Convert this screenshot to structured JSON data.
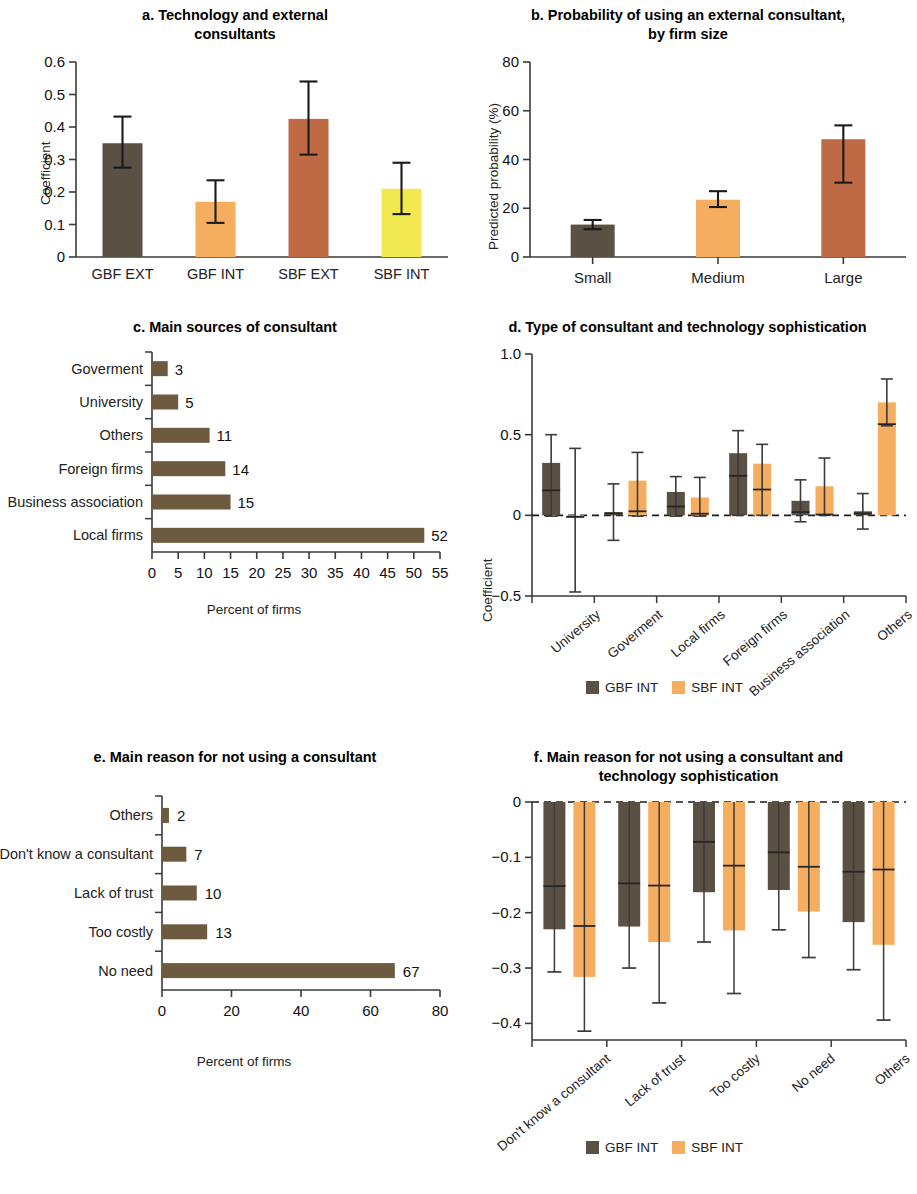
{
  "colors": {
    "dark_brown": "#5a5043",
    "orange": "#f5ad5f",
    "sienna": "#bd6a45",
    "yellow": "#f2e84f",
    "bar_brown": "#6d5a3f",
    "axis": "#3a3a3a",
    "text": "#111111"
  },
  "legend": {
    "series": [
      {
        "label": "GBF INT",
        "color": "#5a5043"
      },
      {
        "label": "SBF INT",
        "color": "#f5ad5f"
      }
    ]
  },
  "chart_data": [
    {
      "id": "a",
      "type": "bar",
      "title": "a. Technology and external consultants",
      "title_lines": [
        "a. Technology and external",
        "consultants"
      ],
      "xlabel": "",
      "ylabel": "Coefficient",
      "ylim": [
        0,
        0.6
      ],
      "yticks": [
        "0",
        "0.1",
        "0.2",
        "0.3",
        "0.4",
        "0.5",
        "0.6"
      ],
      "ytickvals": [
        0,
        0.1,
        0.2,
        0.3,
        0.4,
        0.5,
        0.6
      ],
      "grid": false,
      "categories": [
        "GBF EXT",
        "GBF INT",
        "SBF EXT",
        "SBF INT"
      ],
      "values": [
        0.35,
        0.17,
        0.425,
        0.21
      ],
      "ci_low": [
        0.275,
        0.105,
        0.315,
        0.132
      ],
      "ci_high": [
        0.432,
        0.236,
        0.54,
        0.29
      ],
      "bar_colors": [
        "#5a5043",
        "#f5ad5f",
        "#bd6a45",
        "#f2e84f"
      ]
    },
    {
      "id": "b",
      "type": "bar",
      "title": "b. Probability of using an external consultant, by firm size",
      "title_lines": [
        "b. Probability of using an external consultant,",
        "by firm size"
      ],
      "xlabel": "",
      "ylabel": "Predicted probability (%)",
      "ylim": [
        0,
        80
      ],
      "yticks": [
        "0",
        "20",
        "40",
        "60",
        "80"
      ],
      "ytickvals": [
        0,
        20,
        40,
        60,
        80
      ],
      "grid": false,
      "categories": [
        "Small",
        "Medium",
        "Large"
      ],
      "values": [
        13.3,
        23.5,
        48.3
      ],
      "ci_low": [
        11.4,
        20.5,
        30.5
      ],
      "ci_high": [
        15.2,
        27.0,
        54.0
      ],
      "bar_colors": [
        "#5a5043",
        "#f5ad5f",
        "#bd6a45"
      ]
    },
    {
      "id": "c",
      "type": "bar",
      "orientation": "horizontal",
      "title": "c. Main sources of consultant",
      "title_lines": [
        "c. Main sources of consultant"
      ],
      "xlabel": "Percent of firms",
      "ylabel": "",
      "xlim": [
        0,
        55
      ],
      "xticks": [
        "0",
        "5",
        "10",
        "15",
        "20",
        "25",
        "30",
        "35",
        "40",
        "45",
        "50",
        "55"
      ],
      "xtickvals": [
        0,
        5,
        10,
        15,
        20,
        25,
        30,
        35,
        40,
        45,
        50,
        55
      ],
      "grid": false,
      "categories": [
        "Goverment",
        "University",
        "Others",
        "Foreign firms",
        "Business association",
        "Local firms"
      ],
      "values": [
        3,
        5,
        11,
        14,
        15,
        52
      ],
      "data_labels": [
        "3",
        "5",
        "11",
        "14",
        "15",
        "52"
      ],
      "bar_color": "#6d5a3f"
    },
    {
      "id": "d",
      "type": "bar",
      "title": "d. Type of consultant and technology sophistication",
      "title_lines": [
        "d. Type of consultant and technology sophistication"
      ],
      "xlabel": "",
      "ylabel": "Coefficient",
      "ylim": [
        -0.5,
        1.0
      ],
      "yticks": [
        "-0.5",
        "0",
        "0.5",
        "1.0"
      ],
      "ytickvals": [
        -0.5,
        0,
        0.5,
        1.0
      ],
      "zero_line": true,
      "grid": false,
      "categories": [
        "University",
        "Goverment",
        "Local firms",
        "Foreign firms",
        "Business association",
        "Others"
      ],
      "series": [
        {
          "name": "GBF INT",
          "color": "#5a5043",
          "values": [
            0.155,
            0.012,
            0.055,
            0.245,
            0.02,
            0.012
          ],
          "bar_top": [
            0.325,
            0.02,
            0.145,
            0.385,
            0.09,
            0.025
          ],
          "ci_low": [
            -0.005,
            -0.155,
            -0.005,
            0.0,
            -0.04,
            -0.085
          ],
          "ci_high": [
            0.5,
            0.195,
            0.24,
            0.525,
            0.22,
            0.135
          ]
        },
        {
          "name": "SBF INT",
          "color": "#f5ad5f",
          "values": [
            -0.01,
            0.025,
            0.01,
            0.16,
            0.005,
            0.565
          ],
          "bar_top": [
            -0.01,
            0.215,
            0.11,
            0.32,
            0.18,
            0.7
          ],
          "ci_low": [
            -0.475,
            -0.005,
            -0.005,
            0.0,
            0.0,
            0.555
          ],
          "ci_high": [
            0.415,
            0.39,
            0.235,
            0.44,
            0.355,
            0.845
          ]
        }
      ]
    },
    {
      "id": "e",
      "type": "bar",
      "orientation": "horizontal",
      "title": "e. Main reason for not using a consultant",
      "title_lines": [
        "e. Main reason for not using a consultant"
      ],
      "xlabel": "Percent of firms",
      "ylabel": "",
      "xlim": [
        0,
        80
      ],
      "xticks": [
        "0",
        "20",
        "40",
        "60",
        "80"
      ],
      "xtickvals": [
        0,
        20,
        40,
        60,
        80
      ],
      "grid": false,
      "categories": [
        "Others",
        "Don't know a consultant",
        "Lack of trust",
        "Too costly",
        "No need"
      ],
      "values": [
        2,
        7,
        10,
        13,
        67
      ],
      "data_labels": [
        "2",
        "7",
        "10",
        "13",
        "67"
      ],
      "bar_color": "#6d5a3f"
    },
    {
      "id": "f",
      "type": "bar",
      "title": "f. Main reason for not using a consultant and technology sophistication",
      "title_lines": [
        "f. Main reason for not using a consultant and",
        "technology sophistication"
      ],
      "xlabel": "",
      "ylabel": "Coefficient",
      "ylim": [
        -0.43,
        0
      ],
      "yticks": [
        "0",
        "-0.1",
        "-0.2",
        "-0.3",
        "-0.4"
      ],
      "ytickvals": [
        0,
        -0.1,
        -0.2,
        -0.3,
        -0.4
      ],
      "zero_line": true,
      "grid": false,
      "categories": [
        "Don't know a consultant",
        "Lack of trust",
        "Too costly",
        "No need",
        "Others"
      ],
      "series": [
        {
          "name": "GBF INT",
          "color": "#5a5043",
          "values": [
            -0.152,
            -0.147,
            -0.072,
            -0.091,
            -0.126
          ],
          "bar_bottom": [
            -0.23,
            -0.225,
            -0.163,
            -0.159,
            -0.217
          ],
          "ci_low": [
            -0.307,
            -0.3,
            -0.253,
            -0.231,
            -0.303
          ],
          "ci_high": [
            0.0,
            0.0,
            0.0,
            0.0,
            0.0
          ]
        },
        {
          "name": "SBF INT",
          "color": "#f5ad5f",
          "values": [
            -0.224,
            -0.151,
            -0.115,
            -0.117,
            -0.122
          ],
          "bar_bottom": [
            -0.316,
            -0.253,
            -0.232,
            -0.198,
            -0.258
          ],
          "ci_low": [
            -0.414,
            -0.363,
            -0.346,
            -0.281,
            -0.394
          ],
          "ci_high": [
            0.0,
            0.0,
            0.0,
            0.0,
            0.0
          ]
        }
      ]
    }
  ]
}
